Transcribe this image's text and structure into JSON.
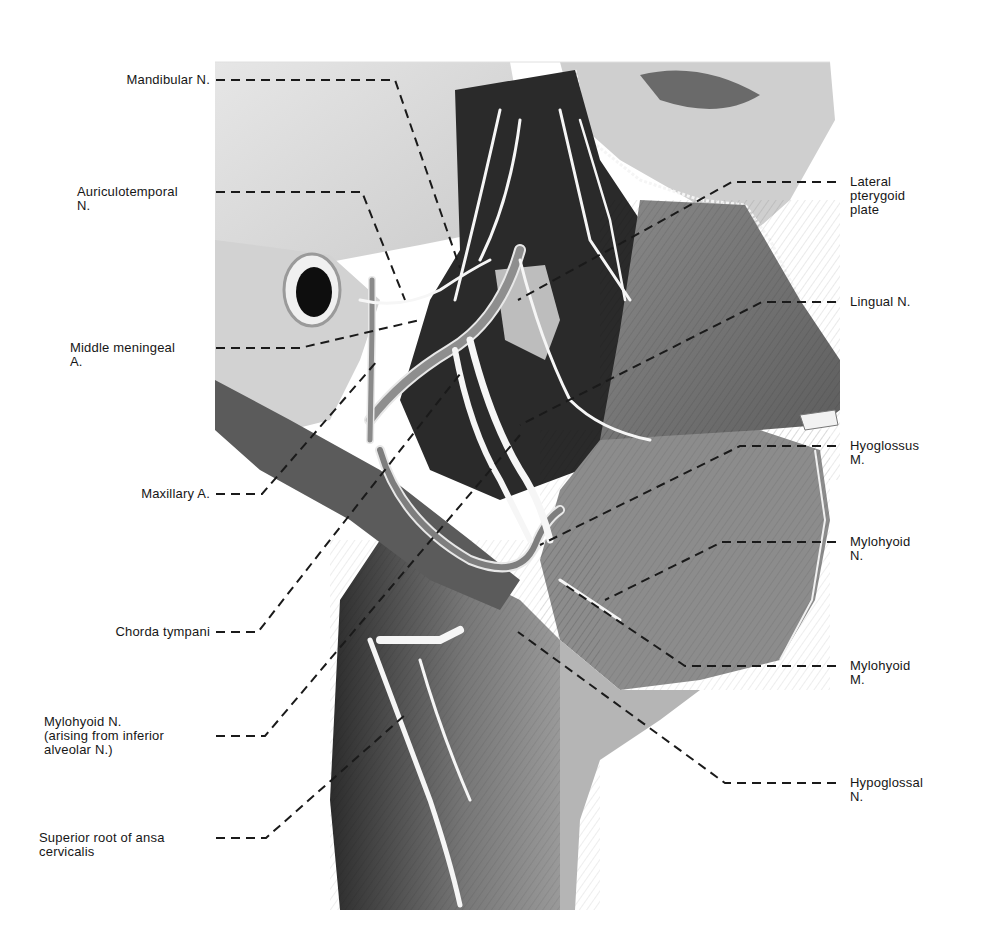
{
  "figure": {
    "type": "anatomical-illustration",
    "view": "lateral dissection of infratemporal region, floor of mouth and upper neck",
    "palette": {
      "background": "#ffffff",
      "bone": "#d9d9d9",
      "muscle_mid": "#7a7a7a",
      "muscle_dark": "#3a3a3a",
      "deep_dark": "#1c1c1c",
      "nerve": "#f4f4f4",
      "leader": "#1a1a1a",
      "text": "#161616"
    }
  },
  "labels_left": [
    {
      "id": "mandibular-n",
      "lines": [
        "Mandibular N."
      ]
    },
    {
      "id": "auriculotemporal-n",
      "lines": [
        "Auriculotemporal",
        "N."
      ]
    },
    {
      "id": "middle-meningeal-a",
      "lines": [
        "Middle meningeal",
        "A."
      ]
    },
    {
      "id": "maxillary-a",
      "lines": [
        "Maxillary A."
      ]
    },
    {
      "id": "chorda-tympani",
      "lines": [
        "Chorda tympani"
      ]
    },
    {
      "id": "mylohyoid-n-left",
      "lines": [
        "Mylohyoid N.",
        "(arising from inferior",
        "alveolar N.)"
      ]
    },
    {
      "id": "superior-root-ansa",
      "lines": [
        "Superior root of ansa",
        "cervicalis"
      ]
    }
  ],
  "labels_right": [
    {
      "id": "lateral-pterygoid-plate",
      "lines": [
        "Lateral",
        "pterygoid",
        "plate"
      ]
    },
    {
      "id": "lingual-n",
      "lines": [
        "Lingual N."
      ]
    },
    {
      "id": "hyoglossus-m",
      "lines": [
        "Hyoglossus",
        "M."
      ]
    },
    {
      "id": "mylohyoid-n-right",
      "lines": [
        "Mylohyoid",
        "N."
      ]
    },
    {
      "id": "mylohyoid-m",
      "lines": [
        "Mylohyoid",
        "M."
      ]
    },
    {
      "id": "hypoglossal-n",
      "lines": [
        "Hypoglossal",
        "N."
      ]
    }
  ],
  "text": {
    "mandibular_n": "Mandibular N.",
    "auriculotemporal_n": "Auriculotemporal\nN.",
    "middle_meningeal_a": "Middle meningeal\nA.",
    "maxillary_a": "Maxillary A.",
    "chorda_tympani": "Chorda tympani",
    "mylohyoid_n_left": "Mylohyoid N.\n(arising from inferior\nalveolar N.)",
    "superior_root_ansa": "Superior root of ansa\ncervicalis",
    "lateral_pterygoid_plate": "Lateral\npterygoid\nplate",
    "lingual_n": "Lingual N.",
    "hyoglossus_m": "Hyoglossus\nM.",
    "mylohyoid_n_right": "Mylohyoid\nN.",
    "mylohyoid_m": "Mylohyoid\nM.",
    "hypoglossal_n": "Hypoglossal\nN."
  }
}
